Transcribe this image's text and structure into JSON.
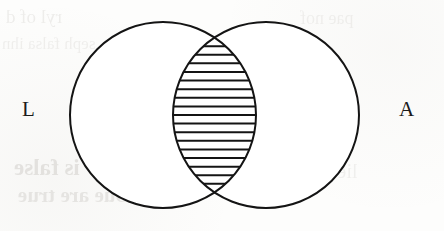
{
  "page": {
    "width": 444,
    "height": 231,
    "background_color": "#fdfdfc",
    "ink_color": "#141414"
  },
  "diagram": {
    "type": "venn-two-set",
    "title": "",
    "stroke_color": "#141414",
    "stroke_width": 2,
    "fill_color": "#ffffff",
    "shaded_region": "intersection",
    "shading_style": "horizontal-hatch",
    "hatch_color": "#141414",
    "hatch_line_count": 17,
    "hatch_spacing_px": 9,
    "circles": [
      {
        "id": "left",
        "label": "L",
        "cx": 163,
        "cy": 115,
        "r": 93
      },
      {
        "id": "right",
        "label": "A",
        "cx": 266,
        "cy": 115,
        "r": 93
      }
    ],
    "labels": {
      "left": "L",
      "right": "A"
    }
  },
  "background_text": {
    "note": "faint mirrored ink bleed-through from reverse side of page",
    "lines": [
      "ryl  of   d",
      "seph   falsa   ihn",
      "is false",
      "bue are true",
      "pae   nof",
      "lie  te"
    ]
  },
  "chart_data": {
    "type": "venn",
    "title": "",
    "sets": [
      {
        "name": "L",
        "label": "L"
      },
      {
        "name": "A",
        "label": "A"
      }
    ],
    "regions": [
      {
        "id": "L-only",
        "sets": [
          "L"
        ],
        "shaded": false
      },
      {
        "id": "A-only",
        "sets": [
          "A"
        ],
        "shaded": false
      },
      {
        "id": "L-and-A",
        "sets": [
          "L",
          "A"
        ],
        "shaded": true
      }
    ],
    "highlighted_region": "L-and-A",
    "legend": "none",
    "grid": false
  }
}
